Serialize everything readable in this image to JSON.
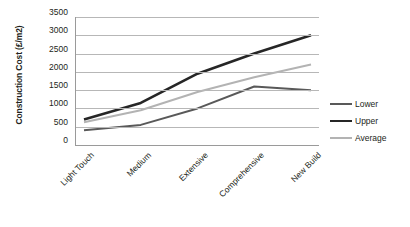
{
  "chart_data": {
    "type": "line",
    "title": "",
    "xlabel": "",
    "ylabel": "Construction Cost (£/m2)",
    "categories": [
      "Light Touch",
      "Medium",
      "Extensive",
      "Comprehensive",
      "New Build"
    ],
    "series": [
      {
        "name": "Lower",
        "values": [
          400,
          550,
          1000,
          1600,
          1500
        ],
        "color": "#595959"
      },
      {
        "name": "Upper",
        "values": [
          700,
          1150,
          1950,
          2500,
          3000
        ],
        "color": "#262626"
      },
      {
        "name": "Average",
        "values": [
          620,
          950,
          1450,
          1850,
          2200
        ],
        "color": "#b3b3b3"
      }
    ],
    "ylim": [
      0,
      3500
    ],
    "ytick_step": 500,
    "yticks": [
      "0",
      "500",
      "1000",
      "1500",
      "2000",
      "2500",
      "3000",
      "3500"
    ],
    "grid": true,
    "legend_position": "right"
  },
  "legend": {
    "items": [
      {
        "label": "Lower"
      },
      {
        "label": "Upper"
      },
      {
        "label": "Average"
      }
    ]
  },
  "colors": {
    "lower": "#595959",
    "upper": "#262626",
    "average": "#b3b3b3",
    "gridline": "#b7b7b7",
    "axis": "#9a9a9a",
    "text": "#231f20",
    "background": "#ffffff"
  }
}
